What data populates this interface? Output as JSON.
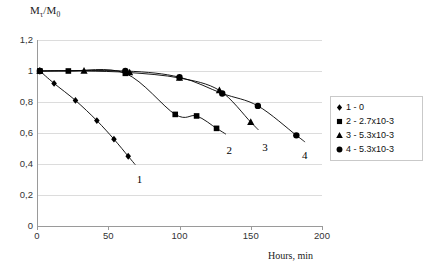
{
  "chart_data": {
    "type": "scatter",
    "title": "",
    "xlabel": "Hours, min",
    "ylabel": "Mτ/M0",
    "ylabel_base": "M",
    "ylabel_sub1": "τ",
    "ylabel_mid": "/M",
    "ylabel_sub2": "0",
    "xlim": [
      0,
      200
    ],
    "ylim": [
      0,
      1.2
    ],
    "xticks": [
      "0",
      "50",
      "100",
      "150",
      "200"
    ],
    "xtick_values": [
      0,
      50,
      100,
      150,
      200
    ],
    "yticks": [
      "0",
      "0,2",
      "0,4",
      "0,6",
      "0,8",
      "1",
      "1,2"
    ],
    "ytick_values": [
      0,
      0.2,
      0.4,
      0.6,
      0.8,
      1.0,
      1.2
    ],
    "grid": "horizontal",
    "legend_position": "right",
    "series": [
      {
        "name": "1 - 0",
        "label": "1",
        "marker": "diamond",
        "color": "#000000",
        "x": [
          2,
          12,
          27,
          42,
          54,
          64
        ],
        "y": [
          1.0,
          0.92,
          0.81,
          0.68,
          0.56,
          0.45
        ]
      },
      {
        "name": "2 - 2.7x10-3",
        "label": "2",
        "marker": "square",
        "color": "#000000",
        "x": [
          2,
          22,
          62,
          97,
          112,
          126
        ],
        "y": [
          1.0,
          1.0,
          0.985,
          0.72,
          0.71,
          0.63
        ]
      },
      {
        "name": "3 - 5.3x10-3",
        "label": "3",
        "marker": "triangle",
        "color": "#000000",
        "x": [
          2,
          33,
          65,
          100,
          128,
          150
        ],
        "y": [
          1.0,
          1.0,
          0.99,
          0.955,
          0.875,
          0.67
        ]
      },
      {
        "name": "4 - 5.3x10-3",
        "label": "4",
        "marker": "circle",
        "color": "#000000",
        "x": [
          2,
          62,
          100,
          130,
          155,
          182
        ],
        "y": [
          1.0,
          1.0,
          0.96,
          0.855,
          0.775,
          0.585
        ]
      }
    ],
    "curve_end_labels": [
      {
        "text": "1",
        "x": 70,
        "y": 0.3
      },
      {
        "text": "2",
        "x": 133,
        "y": 0.485
      },
      {
        "text": "3",
        "x": 158,
        "y": 0.505
      },
      {
        "text": "4",
        "x": 186,
        "y": 0.45
      }
    ]
  },
  "legend": {
    "items": [
      {
        "marker": "diamond",
        "label": "1 - 0"
      },
      {
        "marker": "square",
        "label": "2 - 2.7x10-3"
      },
      {
        "marker": "triangle",
        "label": "3 - 5.3x10-3"
      },
      {
        "marker": "circle",
        "label": "4 - 5.3x10-3"
      }
    ]
  }
}
